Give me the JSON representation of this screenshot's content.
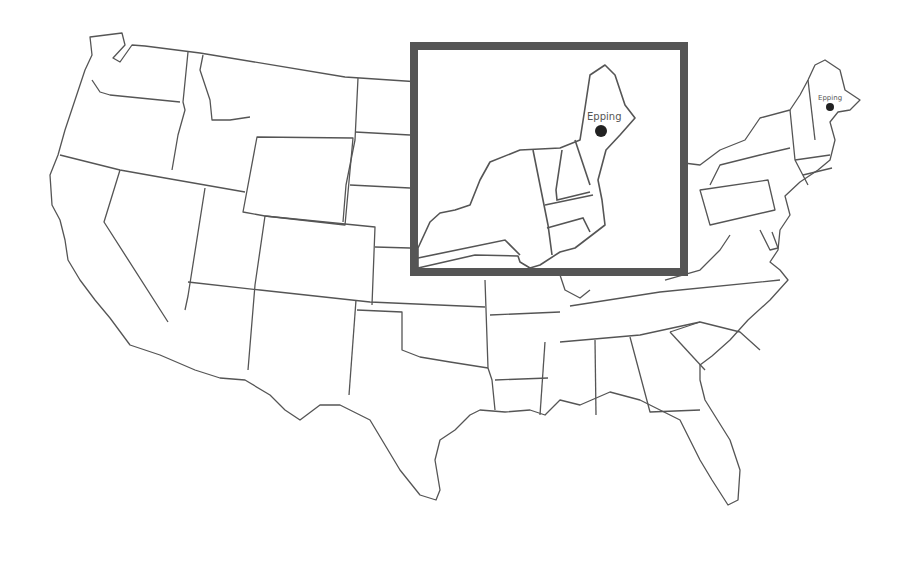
{
  "map": {
    "title": "",
    "region": "Contiguous United States",
    "style": {
      "background": "#ffffff",
      "state_fill": "#ffffff",
      "border_color": "#555555",
      "inset_frame_color": "#555555",
      "marker_color": "#222222"
    },
    "marker": {
      "label": "Epping",
      "state": "New Hampshire"
    },
    "inset": {
      "region": "Northeast United States",
      "marker_label": "Epping"
    }
  }
}
